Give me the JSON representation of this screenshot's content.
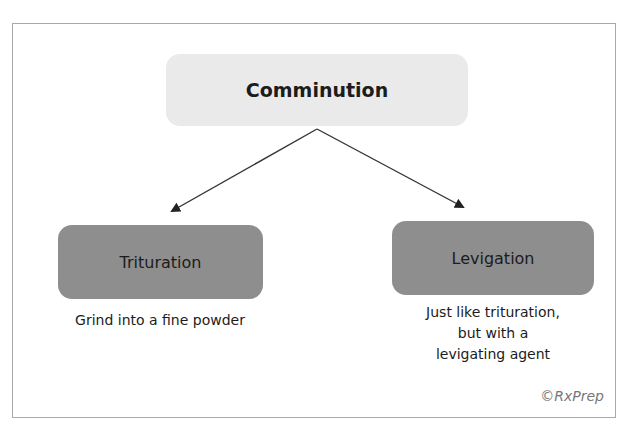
{
  "diagram": {
    "root": {
      "label": "Comminution"
    },
    "children": [
      {
        "label": "Trituration",
        "description": [
          "Grind into a fine powder"
        ]
      },
      {
        "label": "Levigation",
        "description": [
          "Just like trituration,",
          "but with a",
          "levigating agent"
        ]
      }
    ],
    "copyright": "©RxPrep",
    "colors": {
      "root_fill": "#eaeaea",
      "child_fill": "#8e8e8e",
      "arrow": "#333333",
      "frame_border": "#a9a9a9"
    }
  }
}
